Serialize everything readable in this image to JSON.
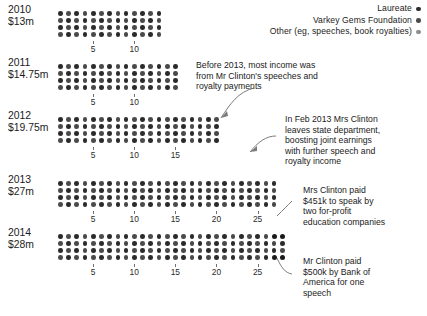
{
  "colors": {
    "laureate": "#2b2b2b",
    "varkey": "#4a4a4a",
    "other": "#8d8d8d",
    "highlight": "#1a1a1a",
    "leader": "#7a7a7a",
    "tick": "#6f6f6f"
  },
  "legend": {
    "items": [
      {
        "label": "Laureate",
        "color_key": "laureate"
      },
      {
        "label": "Varkey Gems Foundation",
        "color_key": "varkey"
      },
      {
        "label": "Other (eg, speeches, book royalties)",
        "color_key": "other"
      }
    ]
  },
  "chart_data": {
    "type": "bar",
    "xlabel": "$m",
    "ylabel": "",
    "unit_per_dot_note": "each dot column = $1m, 4 dots stacked per column",
    "categories": [
      "2010",
      "2011",
      "2012",
      "2013",
      "2014"
    ],
    "values": [
      13,
      14.75,
      19.75,
      27,
      28
    ],
    "value_labels": [
      "$13m",
      "$14.75m",
      "$19.75m",
      "$27m",
      "$28m"
    ],
    "series": [
      {
        "name": "Laureate",
        "values": [
          0,
          0,
          0,
          0,
          0
        ]
      },
      {
        "name": "Varkey Gems Foundation",
        "values": [
          0,
          0,
          0,
          0,
          0
        ]
      },
      {
        "name": "Other (eg, speeches, book royalties)",
        "values": [
          13,
          14.75,
          19.75,
          27,
          28
        ]
      }
    ],
    "rows": [
      {
        "year": "2010",
        "amount": "$13m",
        "columns": 13,
        "ticks": [
          5,
          10
        ]
      },
      {
        "year": "2011",
        "amount": "$14.75m",
        "columns": 15,
        "ticks": [
          5,
          10
        ]
      },
      {
        "year": "2012",
        "amount": "$19.75m",
        "columns": 20,
        "ticks": [
          5,
          10,
          15
        ]
      },
      {
        "year": "2013",
        "amount": "$27m",
        "columns": 27,
        "ticks": [
          5,
          10,
          15,
          20,
          25
        ]
      },
      {
        "year": "2014",
        "amount": "$28m",
        "columns": 28,
        "ticks": [
          5,
          10,
          15,
          20,
          25
        ]
      }
    ],
    "grid": false,
    "legend_position": "top-right"
  },
  "annotations": [
    {
      "id": "pre-2013-note",
      "lines": [
        "Before 2013, most income was",
        "from Mr Clinton's speeches and",
        "royalty payments"
      ]
    },
    {
      "id": "feb-2013-note",
      "lines": [
        "In Feb 2013 Mrs Clinton",
        "leaves state department,",
        "boosting joint earnings",
        "with further speech and",
        "royalty income"
      ]
    },
    {
      "id": "mrs-clinton-451k-note",
      "lines": [
        "Mrs Clinton paid",
        "$451k to speak by",
        "two for-profit",
        "education companies"
      ]
    },
    {
      "id": "mr-clinton-500k-note",
      "lines": [
        "Mr Clinton paid",
        "$500k by Bank of",
        "America for one",
        "speech"
      ]
    }
  ]
}
